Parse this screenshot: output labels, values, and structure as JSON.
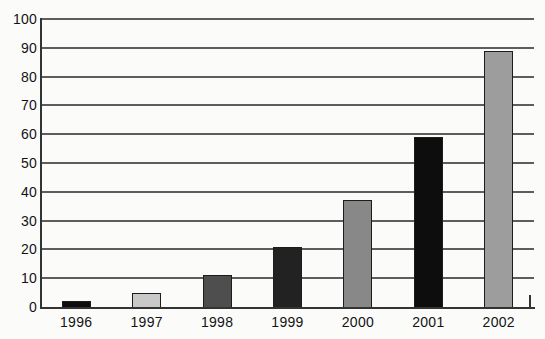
{
  "chart_data": {
    "type": "bar",
    "title": "",
    "xlabel": "",
    "ylabel": "",
    "categories": [
      "1996",
      "1997",
      "1998",
      "1999",
      "2000",
      "2001",
      "2002"
    ],
    "values": [
      2,
      5,
      11,
      21,
      37,
      59,
      89
    ],
    "bar_colors": [
      "#0d0d0d",
      "#c9c9c9",
      "#4e4e4e",
      "#222222",
      "#888888",
      "#0d0d0d",
      "#9d9d9d"
    ],
    "ylim": [
      0,
      100
    ],
    "ytick_interval": 10,
    "ytick_labels": [
      "0",
      "10",
      "20",
      "30",
      "40",
      "50",
      "60",
      "70",
      "80",
      "90",
      "100"
    ],
    "grid": true,
    "legend": false,
    "gridline_color": "#5d5d5d",
    "axis_color": "#333333",
    "background_color": "#fbfbfa",
    "text_color": "#131313"
  }
}
